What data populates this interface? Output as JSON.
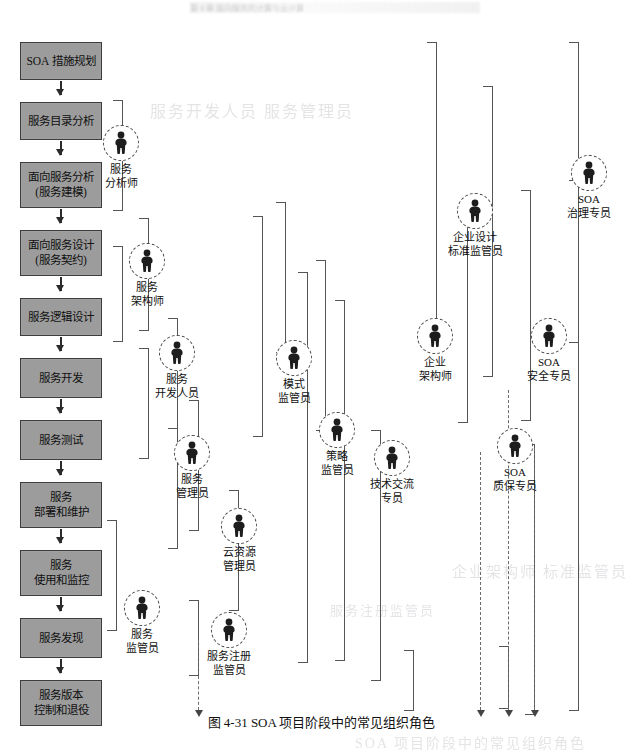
{
  "page": {
    "header_ghost": "第 4 章   面向服务的计算与云计算",
    "caption": "图 4-31    SOA 项目阶段中的常见组织角色",
    "background_color": "#ffffff",
    "box_fill_color": "#9c9c9c",
    "box_border_color": "#3c3c3c",
    "connector_color": "#555555"
  },
  "ghost_text": [
    {
      "text": "服务开发人员  服务管理员",
      "x": 150,
      "y": 98,
      "size": 16
    },
    {
      "text": "SOA 项目阶段中的常见组织角色",
      "x": 355,
      "y": 732,
      "size": 14
    },
    {
      "text": "企业架构师   标准监管员",
      "x": 452,
      "y": 560,
      "size": 15
    },
    {
      "text": "服务注册监管员",
      "x": 330,
      "y": 600,
      "size": 13
    }
  ],
  "process_flow": {
    "title": "SOA 生命周期阶段",
    "stages": [
      {
        "id": "s1",
        "lines": [
          "SOA 措施规划"
        ],
        "y": 42,
        "h": 38
      },
      {
        "id": "s2",
        "lines": [
          "服务目录分析"
        ],
        "y": 102,
        "h": 38
      },
      {
        "id": "s3",
        "lines": [
          "面向服务分析",
          "(服务建模)"
        ],
        "y": 162,
        "h": 46
      },
      {
        "id": "s4",
        "lines": [
          "面向服务设计",
          "(服务契约)"
        ],
        "y": 230,
        "h": 46
      },
      {
        "id": "s5",
        "lines": [
          "服务逻辑设计"
        ],
        "y": 298,
        "h": 38
      },
      {
        "id": "s6",
        "lines": [
          "服务开发"
        ],
        "y": 358,
        "h": 40
      },
      {
        "id": "s7",
        "lines": [
          "服务测试"
        ],
        "y": 420,
        "h": 40
      },
      {
        "id": "s8",
        "lines": [
          "服务",
          "部署和维护"
        ],
        "y": 482,
        "h": 46
      },
      {
        "id": "s9",
        "lines": [
          "服务",
          "使用和监控"
        ],
        "y": 550,
        "h": 46
      },
      {
        "id": "s10",
        "lines": [
          "服务发现"
        ],
        "y": 618,
        "h": 40
      },
      {
        "id": "s11",
        "lines": [
          "服务版本",
          "控制和退役"
        ],
        "y": 680,
        "h": 46
      }
    ]
  },
  "roles": [
    {
      "id": "r1",
      "label": "服务\n分析师",
      "x": 84,
      "y": 125
    },
    {
      "id": "r2",
      "label": "服务\n架构师",
      "x": 110,
      "y": 243
    },
    {
      "id": "r3",
      "label": "服务\n开发人员",
      "x": 140,
      "y": 335
    },
    {
      "id": "r4",
      "label": "服务\n管理员",
      "x": 155,
      "y": 435
    },
    {
      "id": "r5",
      "label": "云资源\n管理员",
      "x": 202,
      "y": 508
    },
    {
      "id": "r6",
      "label": "服务\n监管员",
      "x": 105,
      "y": 590
    },
    {
      "id": "r7",
      "label": "服务注册\n监管员",
      "x": 192,
      "y": 612
    },
    {
      "id": "r8",
      "label": "模式\n监管员",
      "x": 257,
      "y": 340
    },
    {
      "id": "r9",
      "label": "策略\n监管员",
      "x": 300,
      "y": 412
    },
    {
      "id": "r10",
      "label": "技术交流\n专员",
      "x": 355,
      "y": 440
    },
    {
      "id": "r11",
      "label": "企业\n架构师",
      "x": 398,
      "y": 318
    },
    {
      "id": "r12",
      "label": "企业设计\n标准监管员",
      "x": 438,
      "y": 193
    },
    {
      "id": "r13",
      "label": "SOA\n质保专员",
      "x": 478,
      "y": 428
    },
    {
      "id": "r14",
      "label": "SOA\n安全专员",
      "x": 512,
      "y": 318
    },
    {
      "id": "r15",
      "label": "SOA\n治理专员",
      "x": 552,
      "y": 155
    }
  ],
  "connectors": {
    "vertical_lines": [
      {
        "x": 122,
        "y": 100,
        "h": 110
      },
      {
        "x": 148,
        "y": 218,
        "h": 112
      },
      {
        "x": 122,
        "y": 246,
        "h": 95
      },
      {
        "x": 177,
        "y": 318,
        "h": 110
      },
      {
        "x": 148,
        "y": 348,
        "h": 110
      },
      {
        "x": 198,
        "y": 400,
        "h": 130
      },
      {
        "x": 177,
        "y": 428,
        "h": 120
      },
      {
        "x": 238,
        "y": 490,
        "h": 120
      },
      {
        "x": 116,
        "y": 520,
        "h": 110
      },
      {
        "x": 198,
        "y": 600,
        "h": 75
      },
      {
        "x": 285,
        "y": 202,
        "h": 150
      },
      {
        "x": 262,
        "y": 216,
        "h": 220
      },
      {
        "x": 325,
        "y": 260,
        "h": 170
      },
      {
        "x": 307,
        "y": 272,
        "h": 390
      },
      {
        "x": 344,
        "y": 300,
        "h": 360
      },
      {
        "x": 380,
        "y": 430,
        "h": 250
      },
      {
        "x": 436,
        "y": 42,
        "h": 290
      },
      {
        "x": 467,
        "y": 212,
        "h": 210
      },
      {
        "x": 413,
        "y": 650,
        "h": 60
      },
      {
        "x": 508,
        "y": 646,
        "h": 62
      },
      {
        "x": 492,
        "y": 86,
        "h": 290
      },
      {
        "x": 530,
        "y": 190,
        "h": 230
      },
      {
        "x": 578,
        "y": 42,
        "h": 300
      },
      {
        "x": 534,
        "y": 444,
        "h": 270
      },
      {
        "x": 578,
        "y": 180,
        "h": 530
      }
    ],
    "dashed_lines": [
      {
        "x": 198,
        "y": 640,
        "h": 70
      },
      {
        "x": 480,
        "y": 452,
        "h": 258
      },
      {
        "x": 508,
        "y": 390,
        "h": 320
      },
      {
        "x": 534,
        "y": 448,
        "h": 262
      }
    ]
  }
}
